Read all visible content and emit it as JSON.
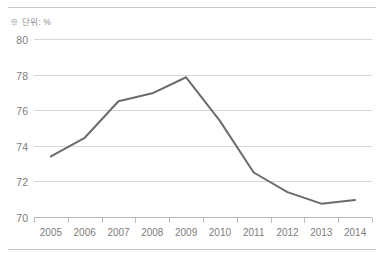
{
  "unit_note": "※ 단위: %",
  "chart_data": {
    "type": "line",
    "title": "",
    "subtitle": "",
    "xlabel": "",
    "ylabel": "",
    "categories": [
      "2005",
      "2006",
      "2007",
      "2008",
      "2009",
      "2010",
      "2011",
      "2012",
      "2013",
      "2014"
    ],
    "series": [
      {
        "name": "",
        "values": [
          73.4,
          74.45,
          76.5,
          76.95,
          77.85,
          75.4,
          72.5,
          71.4,
          70.75,
          70.95
        ],
        "color": "#6b6b6b"
      }
    ],
    "ylim": [
      70,
      80
    ],
    "yticks": [
      70,
      72,
      74,
      76,
      78,
      80
    ],
    "ytick_labels": [
      "70",
      "72",
      "74",
      "76",
      "78",
      "80"
    ],
    "xtick_labels": [
      "2005",
      "2006",
      "2007",
      "2008",
      "2009",
      "2010",
      "2011",
      "2012",
      "2013",
      "2014"
    ],
    "grid": true,
    "grid_axis": "y",
    "legend": false,
    "legend_position": "none",
    "markers": false,
    "annotations": [
      "※ 단위: %"
    ],
    "colors": {
      "line": "#6b6b6b",
      "gridline": "#d5d5d5",
      "axis": "#b9b9b9",
      "tick_text": "#7d7d7d",
      "note_text": "#8c8c8c",
      "rule": "#c9c9c9",
      "background": "#ffffff"
    }
  }
}
